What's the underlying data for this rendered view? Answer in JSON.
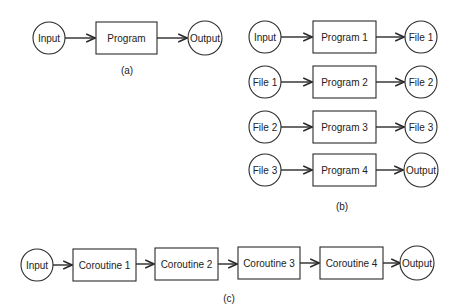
{
  "colors": {
    "stroke": "#2a2a2a",
    "text": "#222222",
    "background": "#ffffff"
  },
  "panel_a": {
    "caption": "(a)",
    "nodes": [
      {
        "id": "a-input",
        "shape": "circle",
        "label": "Input",
        "cx": 49,
        "cy": 38,
        "r": 16
      },
      {
        "id": "a-program",
        "shape": "box",
        "label": "Program",
        "x": 96,
        "y": 22,
        "w": 61,
        "h": 32
      },
      {
        "id": "a-output",
        "shape": "circle",
        "label": "Output",
        "cx": 205,
        "cy": 38,
        "r": 17
      }
    ]
  },
  "panel_b": {
    "caption": "(b)",
    "rows": [
      {
        "in": "Input",
        "program": "Program 1",
        "out": "File 1",
        "cy": 37
      },
      {
        "in": "File 1",
        "program": "Program 2",
        "out": "File 2",
        "cy": 82
      },
      {
        "in": "File 2",
        "program": "Program 3",
        "out": "File 3",
        "cy": 127
      },
      {
        "in": "File 3",
        "program": "Program 4",
        "out": "Output",
        "cy": 170
      }
    ]
  },
  "panel_c": {
    "caption": "(c)",
    "input": "Input",
    "coroutines": [
      "Coroutine 1",
      "Coroutine 2",
      "Coroutine 3",
      "Coroutine 4"
    ],
    "output": "Output"
  }
}
